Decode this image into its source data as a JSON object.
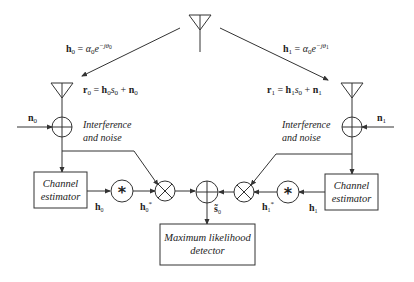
{
  "diagram": {
    "transmitter": {
      "label": ""
    },
    "channels": {
      "left": {
        "label": "h0 = α0 e^{-jθ0}",
        "name": "h",
        "sub": "0",
        "alpha": "α",
        "alpha_sub": "0",
        "exp": "−jθ",
        "exp_sub": "0"
      },
      "right": {
        "label": "h1 = α0 e^{-jθ1}",
        "name": "h",
        "sub": "1",
        "alpha": "α",
        "alpha_sub": "0",
        "exp": "−jθ",
        "exp_sub": "1"
      }
    },
    "received": {
      "left": {
        "r": "r",
        "r_sub": "0",
        "eq": " = ",
        "h": "h",
        "h_sub": "0",
        "s": "s",
        "s_sub": "0",
        "plus": " + ",
        "n": "n",
        "n_sub": "0"
      },
      "right": {
        "r": "r",
        "r_sub": "1",
        "eq": " = ",
        "h": "h",
        "h_sub": "1",
        "s": "s",
        "s_sub": "0",
        "plus": " + ",
        "n": "n",
        "n_sub": "1"
      }
    },
    "noise": {
      "left": {
        "n": "n",
        "sub": "0"
      },
      "right": {
        "n": "n",
        "sub": "1"
      },
      "label_line1": "Interference",
      "label_line2": "and noise"
    },
    "estimator": {
      "line1": "Channel",
      "line2": "estimator"
    },
    "estimates": {
      "left": {
        "h": "h",
        "sub": "0"
      },
      "right": {
        "h": "h",
        "sub": "1"
      }
    },
    "conjugates": {
      "left": {
        "h": "h",
        "sub": "0",
        "sup": "*"
      },
      "right": {
        "h": "h",
        "sub": "1",
        "sup": "*"
      }
    },
    "conjugate_symbol": "*",
    "output": {
      "s": "s̃",
      "sub": "0"
    },
    "detector": {
      "line1": "Maximum likelihood",
      "line2": "detector"
    }
  },
  "colors": {
    "stroke": "#333333",
    "text": "#222222",
    "background": "#ffffff"
  }
}
